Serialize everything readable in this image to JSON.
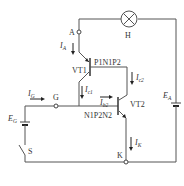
{
  "diagram": {
    "type": "thyristor two-transistor equivalent circuit",
    "nodes": {
      "anode": "A",
      "gate": "G",
      "cathode": "K"
    },
    "lamp": {
      "label": "H"
    },
    "transistors": [
      {
        "name": "VT1",
        "structure": "P1N1P2",
        "kind": "pnp"
      },
      {
        "name": "VT2",
        "structure": "N1P2N2",
        "kind": "npn"
      }
    ],
    "sources": [
      {
        "main": "E",
        "sub": "A"
      },
      {
        "main": "E",
        "sub": "G"
      }
    ],
    "switch": {
      "label": "S"
    },
    "currents": [
      {
        "main": "I",
        "sub": "A"
      },
      {
        "main": "I",
        "sub": "G"
      },
      {
        "main": "I",
        "sub": "c1"
      },
      {
        "main": "I",
        "sub": "c2"
      },
      {
        "main": "I",
        "sub": "b2"
      },
      {
        "main": "I",
        "sub": "K"
      }
    ]
  }
}
